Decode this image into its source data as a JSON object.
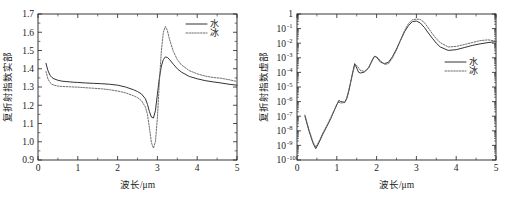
{
  "figure": {
    "panels": [
      "left",
      "right"
    ]
  },
  "chart_data": [
    {
      "type": "line",
      "panel": "left",
      "title": "",
      "xlabel": "波长/μm",
      "ylabel": "复折射指数实部",
      "xlim": [
        0,
        5
      ],
      "ylim": [
        0.9,
        1.7
      ],
      "yscale": "linear",
      "xticks": [
        0,
        1,
        2,
        3,
        4,
        5
      ],
      "xticklabels": [
        "0",
        "1",
        "2",
        "3",
        "4",
        "5"
      ],
      "yticks": [
        0.9,
        1.0,
        1.1,
        1.2,
        1.3,
        1.4,
        1.5,
        1.6,
        1.7
      ],
      "yticklabels": [
        "0.9",
        "1.0",
        "1.1",
        "1.2",
        "1.3",
        "1.4",
        "1.5",
        "1.6",
        "1.7"
      ],
      "grid": false,
      "legend_position": "top-right",
      "legend": [
        "水",
        "冰"
      ],
      "x": [
        0.2,
        0.25,
        0.3,
        0.35,
        0.4,
        0.5,
        0.6,
        0.7,
        0.8,
        0.9,
        1.0,
        1.2,
        1.4,
        1.6,
        1.8,
        2.0,
        2.2,
        2.4,
        2.5,
        2.6,
        2.7,
        2.75,
        2.8,
        2.85,
        2.9,
        2.95,
        3.0,
        3.05,
        3.1,
        3.15,
        3.2,
        3.25,
        3.3,
        3.4,
        3.5,
        3.6,
        3.8,
        4.0,
        4.2,
        4.4,
        4.6,
        4.8,
        5.0
      ],
      "series": [
        {
          "name": "水",
          "style": "solid",
          "values": [
            1.43,
            1.39,
            1.365,
            1.352,
            1.345,
            1.337,
            1.332,
            1.33,
            1.328,
            1.326,
            1.325,
            1.322,
            1.32,
            1.318,
            1.315,
            1.31,
            1.3,
            1.285,
            1.275,
            1.262,
            1.235,
            1.205,
            1.165,
            1.135,
            1.13,
            1.17,
            1.26,
            1.35,
            1.415,
            1.45,
            1.465,
            1.462,
            1.452,
            1.425,
            1.4,
            1.382,
            1.358,
            1.345,
            1.335,
            1.328,
            1.322,
            1.315,
            1.31
          ]
        },
        {
          "name": "冰",
          "style": "dotted",
          "values": [
            1.385,
            1.345,
            1.325,
            1.315,
            1.31,
            1.305,
            1.303,
            1.302,
            1.301,
            1.3,
            1.299,
            1.296,
            1.293,
            1.29,
            1.285,
            1.278,
            1.268,
            1.252,
            1.242,
            1.225,
            1.19,
            1.15,
            1.075,
            0.995,
            0.965,
            1.0,
            1.13,
            1.33,
            1.5,
            1.6,
            1.632,
            1.61,
            1.565,
            1.495,
            1.45,
            1.422,
            1.39,
            1.372,
            1.36,
            1.352,
            1.348,
            1.34,
            1.33
          ]
        }
      ]
    },
    {
      "type": "line",
      "panel": "right",
      "title": "",
      "xlabel": "波长/μm",
      "ylabel": "复折射指数虚部",
      "xlim": [
        0,
        5
      ],
      "ylim": [
        1e-10,
        1
      ],
      "yscale": "log",
      "xticks": [
        0,
        1,
        2,
        3,
        4,
        5
      ],
      "xticklabels": [
        "0",
        "1",
        "2",
        "3",
        "4",
        "5"
      ],
      "yticklabels": [
        "1",
        "10-1",
        "10-2",
        "10-3",
        "10-4",
        "10-5",
        "10-6",
        "10-7",
        "10-8",
        "10-9",
        "10-10"
      ],
      "yexponents": [
        "",
        "-1",
        "-2",
        "-3",
        "-4",
        "-5",
        "-6",
        "-7",
        "-8",
        "-9",
        "-10"
      ],
      "grid": false,
      "legend_position": "right-middle",
      "legend": [
        "水",
        "冰"
      ],
      "x": [
        0.2,
        0.3,
        0.4,
        0.47,
        0.55,
        0.65,
        0.75,
        0.85,
        0.95,
        1.0,
        1.05,
        1.1,
        1.2,
        1.25,
        1.3,
        1.4,
        1.45,
        1.5,
        1.55,
        1.6,
        1.7,
        1.8,
        1.9,
        1.95,
        2.0,
        2.1,
        2.2,
        2.3,
        2.4,
        2.5,
        2.6,
        2.7,
        2.8,
        2.9,
        3.0,
        3.1,
        3.2,
        3.3,
        3.4,
        3.5,
        3.6,
        3.8,
        4.0,
        4.2,
        4.4,
        4.6,
        4.8,
        5.0
      ],
      "series": [
        {
          "name": "水",
          "style": "solid",
          "values": [
            1e-07,
            1e-08,
            1.5e-09,
            6e-10,
            1.5e-09,
            6e-09,
            2e-08,
            7e-08,
            3e-07,
            6e-07,
            1.2e-06,
            1e-06,
            9e-07,
            1.6e-06,
            5e-06,
            0.0001,
            0.0004,
            0.0002,
            0.0001,
            9e-05,
            0.00011,
            0.0002,
            0.0008,
            0.0013,
            0.0011,
            0.0005,
            0.0004,
            0.0005,
            0.0012,
            0.004,
            0.016,
            0.06,
            0.16,
            0.3,
            0.33,
            0.24,
            0.12,
            0.05,
            0.022,
            0.01,
            0.0055,
            0.0032,
            0.0036,
            0.005,
            0.007,
            0.009,
            0.011,
            0.013
          ]
        },
        {
          "name": "冰",
          "style": "dotted",
          "values": [
            1.2e-07,
            1.2e-08,
            1.8e-09,
            7.5e-10,
            1.8e-09,
            7e-09,
            2.3e-08,
            8e-08,
            3.2e-07,
            6.5e-07,
            9e-07,
            8e-07,
            8.5e-07,
            1.8e-06,
            6e-06,
            9e-05,
            0.0003,
            0.0003,
            0.0002,
            0.00013,
            0.00012,
            0.00022,
            0.0007,
            0.0012,
            0.0012,
            0.0006,
            0.00035,
            0.0004,
            0.001,
            0.0035,
            0.015,
            0.07,
            0.22,
            0.4,
            0.45,
            0.42,
            0.26,
            0.11,
            0.045,
            0.02,
            0.011,
            0.0055,
            0.006,
            0.008,
            0.011,
            0.015,
            0.017,
            0.014
          ]
        }
      ]
    }
  ]
}
